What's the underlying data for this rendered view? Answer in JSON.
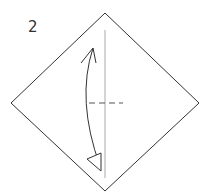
{
  "diagram": {
    "type": "origami-instruction",
    "step_number": "2",
    "paper": {
      "shape": "diamond",
      "fill": "#ffffff",
      "stroke": "#333333"
    },
    "crease_line": {
      "orientation": "vertical",
      "color": "#aaaaaa"
    },
    "fold_line": {
      "style": "dashed",
      "orientation": "horizontal",
      "color": "#555555"
    },
    "arrow": {
      "type": "fold-and-unfold",
      "direction": "top-to-bottom",
      "color": "#333333"
    }
  }
}
